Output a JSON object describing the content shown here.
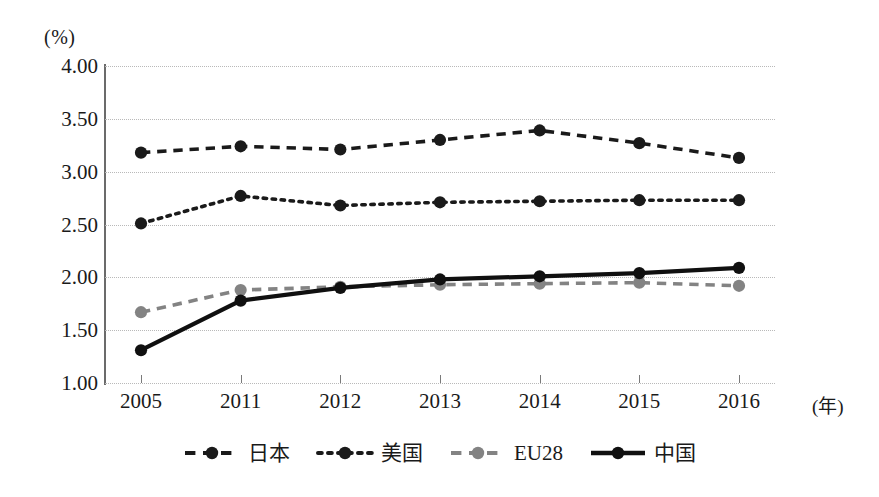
{
  "chart_data": {
    "type": "line",
    "title": "",
    "subtitle": "",
    "xlabel": "年",
    "ylabel": "(%)",
    "y_unit_label": "(%)",
    "x_unit_label": "(年)",
    "categories": [
      "2005",
      "2011",
      "2012",
      "2013",
      "2014",
      "2015",
      "2016"
    ],
    "ylim": [
      1.0,
      4.0
    ],
    "ytick_labels": [
      "4.00",
      "3.50",
      "3.00",
      "2.50",
      "2.00",
      "1.50",
      "1.00"
    ],
    "ytick_values": [
      4.0,
      3.5,
      3.0,
      2.5,
      2.0,
      1.5,
      1.0
    ],
    "grid": true,
    "grid_style": "dotted-horizontal",
    "legend_position": "bottom-center",
    "series": [
      {
        "name": "日本",
        "values": [
          3.18,
          3.24,
          3.21,
          3.3,
          3.39,
          3.27,
          3.13
        ],
        "color": "#1a1a1a",
        "line_style": "dashed",
        "marker": "circle"
      },
      {
        "name": "美国",
        "values": [
          2.51,
          2.77,
          2.68,
          2.71,
          2.72,
          2.73,
          2.73
        ],
        "color": "#1a1a1a",
        "line_style": "dotted",
        "marker": "circle"
      },
      {
        "name": "EU28",
        "values": [
          1.67,
          1.88,
          1.91,
          1.93,
          1.94,
          1.95,
          1.92
        ],
        "color": "#838383",
        "line_style": "dashed",
        "marker": "circle"
      },
      {
        "name": "中国",
        "values": [
          1.31,
          1.78,
          1.9,
          1.98,
          2.01,
          2.04,
          2.09
        ],
        "color": "#101010",
        "line_style": "solid",
        "marker": "circle"
      }
    ]
  }
}
